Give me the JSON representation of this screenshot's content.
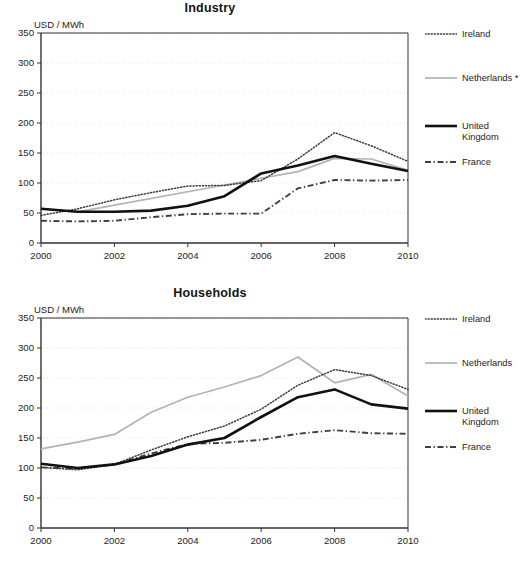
{
  "chart_data": [
    {
      "type": "line",
      "title": "Industry",
      "ylabel": "USD / MWh",
      "xlabel": "",
      "x": [
        2000,
        2001,
        2002,
        2003,
        2004,
        2005,
        2006,
        2007,
        2008,
        2009,
        2010
      ],
      "xlim": [
        2000,
        2010
      ],
      "ylim": [
        0,
        350
      ],
      "yticks": [
        0,
        50,
        100,
        150,
        200,
        250,
        300,
        350
      ],
      "xticks": [
        2000,
        2002,
        2004,
        2006,
        2008,
        2010
      ],
      "grid": true,
      "legend_position": "right",
      "series": [
        {
          "name": "Ireland",
          "style": "dotted",
          "color": "#3a3a3a",
          "x": [
            2000,
            2001,
            2002,
            2003,
            2004,
            2005,
            2006,
            2007,
            2008,
            2009,
            2010
          ],
          "values": [
            46,
            57,
            72,
            84,
            95,
            96,
            104,
            140,
            184,
            162,
            136
          ]
        },
        {
          "name": "Netherlands *",
          "style": "solid-thin",
          "color": "#b3b3b3",
          "x": [
            2000,
            2001,
            2007,
            2008,
            2009,
            2010
          ],
          "values": [
            57,
            52,
            119,
            141,
            140,
            121
          ]
        },
        {
          "name": "United Kingdom",
          "style": "solid-thick",
          "color": "#111111",
          "x": [
            2000,
            2001,
            2002,
            2003,
            2004,
            2005,
            2006,
            2007,
            2008,
            2009,
            2010
          ],
          "values": [
            57,
            52,
            52,
            54,
            62,
            78,
            116,
            129,
            145,
            132,
            120
          ]
        },
        {
          "name": "France",
          "style": "dashdot",
          "color": "#3f3f3f",
          "x": [
            2000,
            2001,
            2002,
            2003,
            2004,
            2005,
            2006,
            2007,
            2008,
            2009,
            2010
          ],
          "values": [
            37,
            36,
            37,
            43,
            48,
            49,
            49,
            91,
            105,
            104,
            105
          ]
        }
      ]
    },
    {
      "type": "line",
      "title": "Households",
      "ylabel": "USD / MWh",
      "xlabel": "",
      "x": [
        2000,
        2001,
        2002,
        2003,
        2004,
        2005,
        2006,
        2007,
        2008,
        2009,
        2010
      ],
      "xlim": [
        2000,
        2010
      ],
      "ylim": [
        0,
        350
      ],
      "yticks": [
        0,
        50,
        100,
        150,
        200,
        250,
        300,
        350
      ],
      "xticks": [
        2000,
        2002,
        2004,
        2006,
        2008,
        2010
      ],
      "grid": true,
      "legend_position": "right",
      "series": [
        {
          "name": "Ireland",
          "style": "dotted",
          "color": "#3a3a3a",
          "x": [
            2000,
            2001,
            2002,
            2003,
            2004,
            2005,
            2006,
            2007,
            2008,
            2009,
            2010
          ],
          "values": [
            101,
            97,
            106,
            130,
            152,
            170,
            198,
            238,
            264,
            254,
            231
          ]
        },
        {
          "name": "Netherlands",
          "style": "solid-thin",
          "color": "#b3b3b3",
          "x": [
            2000,
            2001,
            2002,
            2003,
            2004,
            2005,
            2006,
            2007,
            2008,
            2009,
            2010
          ],
          "values": [
            132,
            143,
            156,
            193,
            218,
            235,
            254,
            285,
            242,
            256,
            220
          ]
        },
        {
          "name": "United Kingdom",
          "style": "solid-thick",
          "color": "#111111",
          "x": [
            2000,
            2001,
            2002,
            2003,
            2004,
            2005,
            2006,
            2007,
            2008,
            2009,
            2010
          ],
          "values": [
            107,
            100,
            106,
            120,
            139,
            150,
            185,
            218,
            231,
            206,
            199
          ]
        },
        {
          "name": "France",
          "style": "dashdot",
          "color": "#3f3f3f",
          "x": [
            2000,
            2001,
            2002,
            2003,
            2004,
            2005,
            2006,
            2007,
            2008,
            2009,
            2010
          ],
          "values": [
            101,
            99,
            106,
            124,
            140,
            142,
            147,
            157,
            163,
            158,
            157
          ]
        }
      ]
    }
  ],
  "panels": [
    {
      "title": "Industry",
      "unit": "USD / MWh",
      "legend": [
        {
          "label": "Ireland",
          "style": "dotted"
        },
        {
          "label": "Netherlands *",
          "style": "solid-thin"
        },
        {
          "label": "United\nKingdom",
          "style": "solid-thick"
        },
        {
          "label": "France",
          "style": "dashdot"
        }
      ]
    },
    {
      "title": "Households",
      "unit": "USD / MWh",
      "legend": [
        {
          "label": "Ireland",
          "style": "dotted"
        },
        {
          "label": "Netherlands",
          "style": "solid-thin"
        },
        {
          "label": "United\nKingdom",
          "style": "solid-thick"
        },
        {
          "label": "France",
          "style": "dashdot"
        }
      ]
    }
  ],
  "colors": {
    "ireland": "#3a3a3a",
    "netherlands": "#b3b3b3",
    "united_kingdom": "#111111",
    "france": "#3f3f3f",
    "axis": "#333333",
    "grid": "#dcdcdc",
    "background": "#ffffff"
  }
}
